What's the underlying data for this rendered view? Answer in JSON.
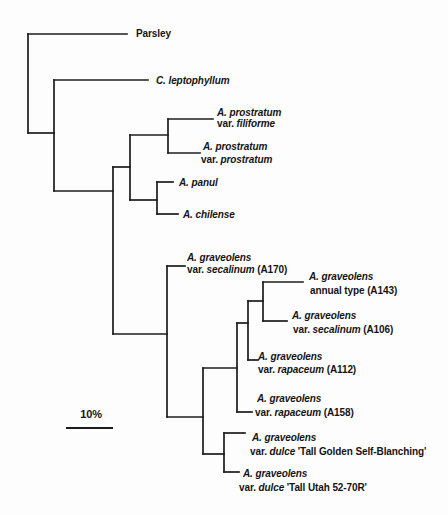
{
  "figure": {
    "type": "phylogenetic-tree",
    "background": "#fdfdfd",
    "stroke_color": "#1c1c1c",
    "stroke_width": 1.7,
    "width": 448,
    "height": 515
  },
  "scale_bar": {
    "label": "10%",
    "x1": 66,
    "x2": 113,
    "y": 428,
    "stroke_width": 2,
    "label_cx": 91,
    "label_cy": 414
  },
  "tree": {
    "verticals": [
      {
        "name": "root-vertical",
        "x": 28,
        "y1": 34,
        "y2": 133
      },
      {
        "name": "node-leptophyllum-vertical",
        "x": 54,
        "y1": 80,
        "y2": 191
      },
      {
        "name": "node-apium-core-vertical",
        "x": 113,
        "y1": 167,
        "y2": 334
      },
      {
        "name": "node-prostratum-panul-vertical",
        "x": 130,
        "y1": 135,
        "y2": 200
      },
      {
        "name": "node-prostratum-pair-vertical",
        "x": 168,
        "y1": 119,
        "y2": 153
      },
      {
        "name": "node-panul-chilense-vertical",
        "x": 157,
        "y1": 182,
        "y2": 214
      },
      {
        "name": "node-graveolens-vertical",
        "x": 167,
        "y1": 266,
        "y2": 417
      },
      {
        "name": "node-graveolens-2-vertical",
        "x": 203,
        "y1": 368,
        "y2": 454
      },
      {
        "name": "node-graveolens-3-vertical",
        "x": 237,
        "y1": 323,
        "y2": 412
      },
      {
        "name": "node-graveolens-4-vertical",
        "x": 248,
        "y1": 301,
        "y2": 360
      },
      {
        "name": "node-a143-a106-vertical",
        "x": 263,
        "y1": 282,
        "y2": 321
      },
      {
        "name": "node-dulce-pair-vertical",
        "x": 224,
        "y1": 433,
        "y2": 472
      }
    ],
    "horizontals": [
      {
        "name": "parsley-branch",
        "y": 34,
        "x1": 28,
        "x2": 127
      },
      {
        "name": "leptophyllum-clade-link",
        "y": 133,
        "x1": 28,
        "x2": 54
      },
      {
        "name": "leptophyllum-branch",
        "y": 80,
        "x1": 54,
        "x2": 148
      },
      {
        "name": "apium-core-link",
        "y": 191,
        "x1": 54,
        "x2": 113
      },
      {
        "name": "prostratum-panul-link",
        "y": 167,
        "x1": 113,
        "x2": 130
      },
      {
        "name": "prostratum-pair-link",
        "y": 135,
        "x1": 130,
        "x2": 168
      },
      {
        "name": "filiforme-branch",
        "y": 119,
        "x1": 168,
        "x2": 213
      },
      {
        "name": "prostratum-branch",
        "y": 153,
        "x1": 168,
        "x2": 200
      },
      {
        "name": "panul-chilense-link",
        "y": 200,
        "x1": 130,
        "x2": 157
      },
      {
        "name": "panul-branch",
        "y": 182,
        "x1": 157,
        "x2": 173
      },
      {
        "name": "chilense-branch",
        "y": 214,
        "x1": 157,
        "x2": 178
      },
      {
        "name": "graveolens-clade-link",
        "y": 334,
        "x1": 113,
        "x2": 167
      },
      {
        "name": "a170-branch",
        "y": 266,
        "x1": 167,
        "x2": 185
      },
      {
        "name": "graveolens-2-link",
        "y": 417,
        "x1": 167,
        "x2": 203
      },
      {
        "name": "graveolens-3-link",
        "y": 368,
        "x1": 203,
        "x2": 237
      },
      {
        "name": "graveolens-4-link",
        "y": 323,
        "x1": 237,
        "x2": 248
      },
      {
        "name": "a143-a106-link",
        "y": 301,
        "x1": 248,
        "x2": 263
      },
      {
        "name": "a143-branch",
        "y": 282,
        "x1": 263,
        "x2": 303
      },
      {
        "name": "a106-branch",
        "y": 321,
        "x1": 263,
        "x2": 287
      },
      {
        "name": "a112-branch",
        "y": 360,
        "x1": 248,
        "x2": 258
      },
      {
        "name": "a158-branch",
        "y": 412,
        "x1": 237,
        "x2": 252
      },
      {
        "name": "dulce-pair-link",
        "y": 454,
        "x1": 203,
        "x2": 224
      },
      {
        "name": "dulce-tgsb-branch",
        "y": 433,
        "x1": 224,
        "x2": 245
      },
      {
        "name": "dulce-utah-branch",
        "y": 472,
        "x1": 224,
        "x2": 239
      }
    ],
    "labels": [
      {
        "name": "label-parsley",
        "x": 136,
        "y": 33,
        "runs": [
          {
            "t": "Parsley",
            "i": false
          }
        ]
      },
      {
        "name": "label-leptophyllum",
        "x": 156,
        "y": 80,
        "runs": [
          {
            "t": "C. leptophyllum",
            "i": true
          }
        ]
      },
      {
        "name": "label-filiforme-1",
        "x": 217,
        "y": 112,
        "runs": [
          {
            "t": "A. prostratum",
            "i": true
          }
        ]
      },
      {
        "name": "label-filiforme-2",
        "x": 217,
        "y": 123,
        "runs": [
          {
            "t": "var. ",
            "i": false
          },
          {
            "t": "filiforme",
            "i": true
          }
        ]
      },
      {
        "name": "label-prostratum-1",
        "x": 203,
        "y": 146,
        "runs": [
          {
            "t": "A. prostratum",
            "i": true
          }
        ]
      },
      {
        "name": "label-prostratum-2",
        "x": 201,
        "y": 159,
        "runs": [
          {
            "t": "var. ",
            "i": false
          },
          {
            "t": "prostratum",
            "i": true
          }
        ]
      },
      {
        "name": "label-panul",
        "x": 179,
        "y": 182,
        "runs": [
          {
            "t": "A. panul",
            "i": true
          }
        ]
      },
      {
        "name": "label-chilense",
        "x": 183,
        "y": 214,
        "runs": [
          {
            "t": "A. chilense",
            "i": true
          }
        ]
      },
      {
        "name": "label-a170-1",
        "x": 187,
        "y": 257,
        "runs": [
          {
            "t": "A. graveolens",
            "i": true
          }
        ]
      },
      {
        "name": "label-a170-2",
        "x": 187,
        "y": 269,
        "runs": [
          {
            "t": "var. ",
            "i": false
          },
          {
            "t": "secalinum",
            "i": true
          },
          {
            "t": " (A170)",
            "i": false
          }
        ]
      },
      {
        "name": "label-a143-1",
        "x": 309,
        "y": 276,
        "runs": [
          {
            "t": "A. graveolens",
            "i": true
          }
        ]
      },
      {
        "name": "label-a143-2",
        "x": 310,
        "y": 290,
        "runs": [
          {
            "t": "annual type (A143)",
            "i": false
          }
        ]
      },
      {
        "name": "label-a106-1",
        "x": 292,
        "y": 315,
        "runs": [
          {
            "t": "A. graveolens",
            "i": true
          }
        ]
      },
      {
        "name": "label-a106-2",
        "x": 293,
        "y": 329,
        "runs": [
          {
            "t": "var. ",
            "i": false
          },
          {
            "t": "secalinum",
            "i": true
          },
          {
            "t": " (A106)",
            "i": false
          }
        ]
      },
      {
        "name": "label-a112-1",
        "x": 258,
        "y": 356,
        "runs": [
          {
            "t": "A. graveolens",
            "i": true
          }
        ]
      },
      {
        "name": "label-a112-2",
        "x": 258,
        "y": 369,
        "runs": [
          {
            "t": "var. ",
            "i": false
          },
          {
            "t": "rapaceum",
            "i": true
          },
          {
            "t": " (A112)",
            "i": false
          }
        ]
      },
      {
        "name": "label-a158-1",
        "x": 257,
        "y": 398,
        "runs": [
          {
            "t": "A. graveolens",
            "i": true
          }
        ]
      },
      {
        "name": "label-a158-2",
        "x": 255,
        "y": 412,
        "runs": [
          {
            "t": "var. ",
            "i": false
          },
          {
            "t": "rapaceum",
            "i": true
          },
          {
            "t": " (A158)",
            "i": false
          }
        ]
      },
      {
        "name": "label-tgsb-1",
        "x": 252,
        "y": 437,
        "runs": [
          {
            "t": "A. graveolens",
            "i": true
          }
        ]
      },
      {
        "name": "label-tgsb-2",
        "x": 250,
        "y": 451,
        "runs": [
          {
            "t": "var. ",
            "i": false
          },
          {
            "t": "dulce",
            "i": true
          },
          {
            "t": " 'Tall Golden Self-Blanching'",
            "i": false
          }
        ]
      },
      {
        "name": "label-utah-1",
        "x": 243,
        "y": 473,
        "runs": [
          {
            "t": "A. graveolens",
            "i": true
          }
        ]
      },
      {
        "name": "label-utah-2",
        "x": 239,
        "y": 487,
        "runs": [
          {
            "t": "var. ",
            "i": false
          },
          {
            "t": "dulce",
            "i": true
          },
          {
            "t": " 'Tall Utah 52-70R'",
            "i": false
          }
        ]
      }
    ]
  }
}
